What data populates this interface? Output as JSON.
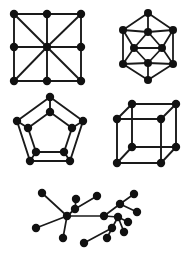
{
  "figure": {
    "background_color": "#ffffff",
    "edge_color": "#1a1a1a",
    "node_color": "#111111",
    "width": 189,
    "height": 258
  },
  "chart_data": {
    "type": "diagram",
    "title": "",
    "subtitle": "",
    "xlabel": "",
    "ylabel": "",
    "grid": false,
    "legend": "none",
    "graphs": [
      {
        "name": "grid-graph-with-diagonals",
        "label": "",
        "node_radius": 4.2,
        "edge_width": 1.9,
        "vertex_count": 9,
        "edge_count": 16,
        "nodes": [
          {
            "id": 0,
            "x": 14,
            "y": 14
          },
          {
            "id": 1,
            "x": 47,
            "y": 14
          },
          {
            "id": 2,
            "x": 81,
            "y": 14
          },
          {
            "id": 3,
            "x": 14,
            "y": 47
          },
          {
            "id": 4,
            "x": 47,
            "y": 47
          },
          {
            "id": 5,
            "x": 81,
            "y": 47
          },
          {
            "id": 6,
            "x": 14,
            "y": 81
          },
          {
            "id": 7,
            "x": 47,
            "y": 81
          },
          {
            "id": 8,
            "x": 81,
            "y": 81
          }
        ],
        "edges": [
          [
            0,
            1
          ],
          [
            1,
            2
          ],
          [
            3,
            4
          ],
          [
            4,
            5
          ],
          [
            6,
            7
          ],
          [
            7,
            8
          ],
          [
            0,
            3
          ],
          [
            3,
            6
          ],
          [
            1,
            4
          ],
          [
            4,
            7
          ],
          [
            2,
            5
          ],
          [
            5,
            8
          ],
          [
            0,
            4
          ],
          [
            2,
            4
          ],
          [
            6,
            4
          ],
          [
            8,
            4
          ]
        ]
      },
      {
        "name": "icosahedral-hexagon-graph",
        "label": "",
        "node_radius": 4.0,
        "edge_width": 1.8,
        "vertex_count": 10,
        "edge_count": 21,
        "nodes": [
          {
            "id": 0,
            "x": 148,
            "y": 13
          },
          {
            "id": 1,
            "x": 123,
            "y": 30
          },
          {
            "id": 2,
            "x": 173,
            "y": 30
          },
          {
            "id": 3,
            "x": 148,
            "y": 32
          },
          {
            "id": 4,
            "x": 134,
            "y": 48
          },
          {
            "id": 5,
            "x": 162,
            "y": 48
          },
          {
            "id": 6,
            "x": 123,
            "y": 64
          },
          {
            "id": 7,
            "x": 173,
            "y": 64
          },
          {
            "id": 8,
            "x": 148,
            "y": 63
          },
          {
            "id": 9,
            "x": 148,
            "y": 80
          }
        ],
        "edges": [
          [
            0,
            1
          ],
          [
            0,
            2
          ],
          [
            1,
            6
          ],
          [
            2,
            7
          ],
          [
            6,
            9
          ],
          [
            7,
            9
          ],
          [
            0,
            3
          ],
          [
            1,
            3
          ],
          [
            2,
            3
          ],
          [
            3,
            4
          ],
          [
            3,
            5
          ],
          [
            1,
            4
          ],
          [
            2,
            5
          ],
          [
            4,
            6
          ],
          [
            5,
            7
          ],
          [
            4,
            8
          ],
          [
            5,
            8
          ],
          [
            6,
            8
          ],
          [
            7,
            8
          ],
          [
            8,
            9
          ],
          [
            4,
            5
          ]
        ]
      },
      {
        "name": "pentagonal-prism-graph",
        "label": "",
        "node_radius": 4.2,
        "edge_width": 1.9,
        "vertex_count": 10,
        "edge_count": 15,
        "nodes": [
          {
            "id": 0,
            "x": 50,
            "y": 97
          },
          {
            "id": 1,
            "x": 17,
            "y": 121
          },
          {
            "id": 2,
            "x": 83,
            "y": 121
          },
          {
            "id": 3,
            "x": 30,
            "y": 161
          },
          {
            "id": 4,
            "x": 70,
            "y": 161
          },
          {
            "id": 5,
            "x": 50,
            "y": 112
          },
          {
            "id": 6,
            "x": 28,
            "y": 128
          },
          {
            "id": 7,
            "x": 72,
            "y": 128
          },
          {
            "id": 8,
            "x": 36,
            "y": 152
          },
          {
            "id": 9,
            "x": 64,
            "y": 152
          }
        ],
        "edges": [
          [
            0,
            1
          ],
          [
            1,
            3
          ],
          [
            3,
            4
          ],
          [
            4,
            2
          ],
          [
            2,
            0
          ],
          [
            5,
            6
          ],
          [
            6,
            8
          ],
          [
            8,
            9
          ],
          [
            9,
            7
          ],
          [
            7,
            5
          ],
          [
            0,
            5
          ],
          [
            1,
            6
          ],
          [
            3,
            8
          ],
          [
            4,
            9
          ],
          [
            2,
            7
          ]
        ]
      },
      {
        "name": "cube-graph",
        "label": "",
        "node_radius": 4.2,
        "edge_width": 1.9,
        "vertex_count": 8,
        "edge_count": 12,
        "nodes": [
          {
            "id": 0,
            "x": 132,
            "y": 104
          },
          {
            "id": 1,
            "x": 176,
            "y": 104
          },
          {
            "id": 2,
            "x": 117,
            "y": 119
          },
          {
            "id": 3,
            "x": 161,
            "y": 119
          },
          {
            "id": 4,
            "x": 132,
            "y": 147
          },
          {
            "id": 5,
            "x": 176,
            "y": 147
          },
          {
            "id": 6,
            "x": 117,
            "y": 163
          },
          {
            "id": 7,
            "x": 161,
            "y": 163
          }
        ],
        "edges": [
          [
            0,
            1
          ],
          [
            0,
            2
          ],
          [
            1,
            3
          ],
          [
            2,
            3
          ],
          [
            4,
            5
          ],
          [
            4,
            6
          ],
          [
            5,
            7
          ],
          [
            6,
            7
          ],
          [
            0,
            4
          ],
          [
            1,
            5
          ],
          [
            2,
            6
          ],
          [
            3,
            7
          ]
        ]
      },
      {
        "name": "tree-graph",
        "label": "",
        "node_radius": 4.2,
        "edge_width": 1.7,
        "vertex_count": 17,
        "edge_count": 16,
        "nodes": [
          {
            "id": 0,
            "x": 42,
            "y": 193
          },
          {
            "id": 1,
            "x": 67,
            "y": 216
          },
          {
            "id": 2,
            "x": 36,
            "y": 228
          },
          {
            "id": 3,
            "x": 63,
            "y": 238
          },
          {
            "id": 4,
            "x": 76,
            "y": 199
          },
          {
            "id": 5,
            "x": 75,
            "y": 209
          },
          {
            "id": 6,
            "x": 97,
            "y": 196
          },
          {
            "id": 7,
            "x": 104,
            "y": 216
          },
          {
            "id": 8,
            "x": 120,
            "y": 204
          },
          {
            "id": 9,
            "x": 134,
            "y": 194
          },
          {
            "id": 10,
            "x": 137,
            "y": 212
          },
          {
            "id": 11,
            "x": 112,
            "y": 228
          },
          {
            "id": 12,
            "x": 124,
            "y": 232
          },
          {
            "id": 13,
            "x": 107,
            "y": 238
          },
          {
            "id": 14,
            "x": 84,
            "y": 243
          },
          {
            "id": 15,
            "x": 118,
            "y": 217
          },
          {
            "id": 16,
            "x": 128,
            "y": 222
          }
        ],
        "edges": [
          [
            0,
            1
          ],
          [
            1,
            2
          ],
          [
            1,
            3
          ],
          [
            1,
            5
          ],
          [
            5,
            4
          ],
          [
            5,
            6
          ],
          [
            1,
            7
          ],
          [
            7,
            8
          ],
          [
            8,
            9
          ],
          [
            8,
            10
          ],
          [
            7,
            15
          ],
          [
            15,
            16
          ],
          [
            15,
            11
          ],
          [
            11,
            13
          ],
          [
            11,
            14
          ],
          [
            15,
            12
          ]
        ]
      }
    ]
  }
}
